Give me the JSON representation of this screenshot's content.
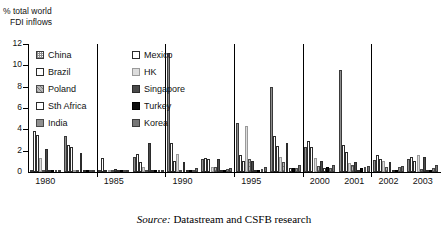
{
  "axis_title_line1": "% total world",
  "axis_title_line2": "FDI inflows",
  "source": {
    "prefix": "Source:",
    "text": " Datastream and CSFB research"
  },
  "legend": [
    [
      {
        "label": "China",
        "key": "china"
      },
      {
        "label": "Mexico",
        "key": "mexico"
      }
    ],
    [
      {
        "label": "Brazil",
        "key": "brazil"
      },
      {
        "label": "HK",
        "key": "hk"
      }
    ],
    [
      {
        "label": "Poland",
        "key": "poland"
      },
      {
        "label": "Singapore",
        "key": "singapore"
      }
    ],
    [
      {
        "label": "Sth Africa",
        "key": "sthafrica"
      },
      {
        "label": "Turkey",
        "key": "turkey"
      }
    ],
    [
      {
        "label": "India",
        "key": "india"
      },
      {
        "label": "Korea",
        "key": "korea"
      }
    ]
  ],
  "chart_data": {
    "type": "bar",
    "title": "",
    "xlabel": "",
    "ylabel": "% total world FDI inflows",
    "ylim": [
      0,
      12
    ],
    "yticks": [
      0,
      2,
      4,
      6,
      8,
      10,
      12
    ],
    "grid": false,
    "legend_position": "top-left",
    "categories": [
      "1980",
      "1983",
      "1985",
      "1988",
      "1990",
      "1993",
      "1995",
      "1998",
      "2000",
      "2001",
      "2002",
      "2003"
    ],
    "tick_labels": [
      "1980",
      "",
      "1985",
      "",
      "1990",
      "",
      "1995",
      "",
      "2000",
      "2001",
      "2002",
      "2003"
    ],
    "series": [
      {
        "name": "China",
        "key": "china",
        "values": [
          0.1,
          3.4,
          0.2,
          1.4,
          11.2,
          1.2,
          4.6,
          8.0,
          2.3,
          9.6,
          1.1,
          1.2
        ]
      },
      {
        "name": "Mexico",
        "key": "mexico",
        "values": [
          3.8,
          2.5,
          1.3,
          1.7,
          2.7,
          1.3,
          1.6,
          3.4,
          2.9,
          2.5,
          1.6,
          1.4
        ]
      },
      {
        "name": "Brazil",
        "key": "brazil",
        "values": [
          3.5,
          2.3,
          0.1,
          0.9,
          1.0,
          1.2,
          1.0,
          2.4,
          2.3,
          1.9,
          1.2,
          1.0
        ]
      },
      {
        "name": "HK",
        "key": "hk",
        "values": [
          1.3,
          0.1,
          0.2,
          0.5,
          1.7,
          0.5,
          4.3,
          1.4,
          1.3,
          0.8,
          1.0,
          1.6
        ]
      },
      {
        "name": "Poland",
        "key": "poland",
        "values": [
          0.05,
          0.05,
          0.1,
          0.1,
          0.2,
          0.5,
          1.2,
          0.9,
          0.6,
          0.7,
          0.5,
          0.3
        ]
      },
      {
        "name": "Singapore",
        "key": "singapore",
        "values": [
          2.2,
          1.8,
          0.3,
          2.7,
          0.9,
          1.2,
          1.0,
          2.7,
          1.0,
          0.9,
          0.9,
          1.4
        ]
      },
      {
        "name": "Sth Africa",
        "key": "sthafrica",
        "values": [
          0.05,
          0.05,
          0.1,
          0.05,
          0.2,
          0.2,
          0.2,
          0.4,
          0.4,
          0.2,
          0.2,
          0.1
        ]
      },
      {
        "name": "Turkey",
        "key": "turkey",
        "values": [
          0.05,
          0.05,
          0.1,
          0.1,
          0.2,
          0.2,
          0.2,
          0.4,
          0.5,
          0.4,
          0.2,
          0.2
        ]
      },
      {
        "name": "India",
        "key": "india",
        "values": [
          0.05,
          0.05,
          0.1,
          0.1,
          0.2,
          0.3,
          0.3,
          0.4,
          0.4,
          0.5,
          0.5,
          0.4
        ]
      },
      {
        "name": "Korea",
        "key": "korea",
        "values": [
          0.05,
          0.05,
          0.15,
          0.1,
          0.35,
          0.4,
          0.5,
          0.7,
          0.7,
          0.6,
          0.6,
          0.7
        ]
      }
    ]
  }
}
